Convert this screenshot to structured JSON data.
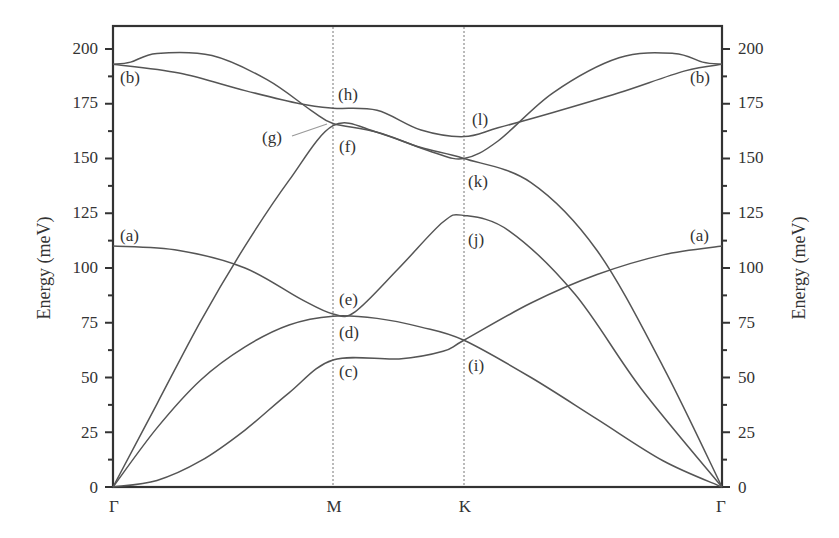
{
  "chart_data": {
    "type": "line",
    "title": "",
    "xlabel": "",
    "ylabel": "Energy (meV)",
    "ylabel_right": "Energy (meV)",
    "ylim": [
      0,
      210
    ],
    "yticks_major": [
      0,
      25,
      50,
      75,
      100,
      125,
      150,
      175,
      200
    ],
    "yticks_minor_step": 12.5,
    "grid": false,
    "high_symmetry_points": [
      {
        "label": "Γ",
        "x": 0.0
      },
      {
        "label": "M",
        "x": 1.0
      },
      {
        "label": "K",
        "x": 1.595
      },
      {
        "label": "Γ",
        "x": 2.768
      }
    ],
    "vertical_dotted_lines_at": [
      "M",
      "K"
    ],
    "series": [
      {
        "name": "ZA",
        "points": [
          [
            0,
            0
          ],
          [
            0.2,
            3
          ],
          [
            0.4,
            12
          ],
          [
            0.6,
            26
          ],
          [
            0.8,
            43
          ],
          [
            1.0,
            58
          ],
          [
            1.3,
            58.5
          ],
          [
            1.5,
            62
          ],
          [
            1.595,
            67
          ],
          [
            1.9,
            84
          ],
          [
            2.2,
            97
          ],
          [
            2.5,
            106
          ],
          [
            2.768,
            110
          ]
        ]
      },
      {
        "name": "TA",
        "points": [
          [
            0,
            0
          ],
          [
            0.2,
            27
          ],
          [
            0.4,
            49
          ],
          [
            0.6,
            64
          ],
          [
            0.8,
            74
          ],
          [
            1.0,
            78
          ],
          [
            1.2,
            77
          ],
          [
            1.4,
            73
          ],
          [
            1.595,
            67
          ],
          [
            1.9,
            50
          ],
          [
            2.2,
            31
          ],
          [
            2.5,
            12
          ],
          [
            2.768,
            0
          ]
        ]
      },
      {
        "name": "ZO-lower",
        "points": [
          [
            0,
            0
          ],
          [
            0.3,
            2
          ],
          [
            0.6,
            10
          ],
          [
            0.9,
            30
          ],
          [
            1.0,
            40
          ]
        ]
      },
      {
        "name": "LA",
        "points": [
          [
            0,
            0
          ],
          [
            0.2,
            38
          ],
          [
            0.4,
            76
          ],
          [
            0.6,
            110
          ],
          [
            0.8,
            140
          ],
          [
            1.0,
            165
          ],
          [
            1.2,
            162
          ],
          [
            1.4,
            155
          ],
          [
            1.595,
            150
          ],
          [
            1.9,
            139
          ],
          [
            2.2,
            108
          ],
          [
            2.5,
            55
          ],
          [
            2.768,
            0
          ]
        ]
      },
      {
        "name": "ZO",
        "points": [
          [
            0,
            110
          ],
          [
            0.3,
            108
          ],
          [
            0.6,
            100
          ],
          [
            0.85,
            86
          ],
          [
            1.0,
            79
          ],
          [
            1.1,
            80
          ],
          [
            1.3,
            100
          ],
          [
            1.5,
            121
          ],
          [
            1.595,
            124
          ],
          [
            1.8,
            117
          ],
          [
            2.1,
            88
          ],
          [
            2.4,
            45
          ],
          [
            2.768,
            0
          ]
        ]
      },
      {
        "name": "TO",
        "points": [
          [
            0,
            193
          ],
          [
            0.3,
            189
          ],
          [
            0.6,
            181
          ],
          [
            0.85,
            175
          ],
          [
            1.0,
            173
          ],
          [
            1.2,
            172
          ],
          [
            1.4,
            163
          ],
          [
            1.595,
            160
          ],
          [
            1.75,
            164
          ],
          [
            2.0,
            171
          ],
          [
            2.3,
            180
          ],
          [
            2.6,
            190
          ],
          [
            2.768,
            193
          ]
        ]
      },
      {
        "name": "LO",
        "points": [
          [
            0,
            193
          ],
          [
            0.08,
            194
          ],
          [
            0.2,
            198
          ],
          [
            0.45,
            197
          ],
          [
            0.7,
            186
          ],
          [
            0.9,
            172
          ],
          [
            1.0,
            166
          ],
          [
            1.2,
            162
          ],
          [
            1.45,
            153
          ],
          [
            1.595,
            150
          ],
          [
            1.75,
            158
          ],
          [
            2.0,
            180
          ],
          [
            2.3,
            196
          ],
          [
            2.55,
            198
          ],
          [
            2.68,
            194
          ],
          [
            2.768,
            193
          ]
        ]
      }
    ],
    "annotations": [
      {
        "label": "(a)",
        "at": "Γ-left",
        "value": 110
      },
      {
        "label": "(a)",
        "at": "Γ-right",
        "value": 110
      },
      {
        "label": "(b)",
        "at": "Γ-left",
        "value": 193
      },
      {
        "label": "(b)",
        "at": "Γ-right",
        "value": 193
      },
      {
        "label": "(c)",
        "at": "M",
        "value": 58
      },
      {
        "label": "(d)",
        "at": "M",
        "value": 78
      },
      {
        "label": "(e)",
        "at": "M",
        "value": 79
      },
      {
        "label": "(f)",
        "at": "M",
        "value": 165
      },
      {
        "label": "(g)",
        "at": "M",
        "value": 166
      },
      {
        "label": "(h)",
        "at": "M",
        "value": 173
      },
      {
        "label": "(i)",
        "at": "K",
        "value": 67
      },
      {
        "label": "(j)",
        "at": "K",
        "value": 124
      },
      {
        "label": "(k)",
        "at": "K",
        "value": 150
      },
      {
        "label": "(l)",
        "at": "K",
        "value": 160
      }
    ]
  },
  "axis": {
    "ylabel": "Energy (meV)",
    "tick_labels": [
      "0",
      "25",
      "50",
      "75",
      "100",
      "125",
      "150",
      "175",
      "200"
    ],
    "x_labels": [
      "Γ",
      "M",
      "K",
      "Γ"
    ]
  },
  "labels": {
    "a": "(a)",
    "b": "(b)",
    "c": "(c)",
    "d": "(d)",
    "e": "(e)",
    "f": "(f)",
    "g": "(g)",
    "h": "(h)",
    "i": "(i)",
    "j": "(j)",
    "k": "(k)",
    "l": "(l)"
  }
}
